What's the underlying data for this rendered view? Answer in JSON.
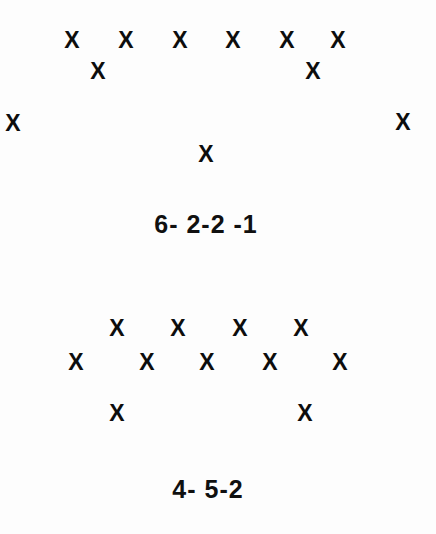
{
  "diagram": {
    "title_visible": false,
    "background_color": "#fdfdfd",
    "marker_color": "#0d0d0d",
    "marker_glyph": "X",
    "formations": [
      {
        "name": "formation-top",
        "label": "6- 2-2 -1",
        "label_position": {
          "x": 206,
          "y": 224
        },
        "player_count": 11,
        "lines": "6-2-2-1",
        "players": [
          {
            "id": "t1",
            "glyph": "X",
            "x": 72,
            "y": 40,
            "row": 1
          },
          {
            "id": "t2",
            "glyph": "X",
            "x": 126,
            "y": 40,
            "row": 1
          },
          {
            "id": "t3",
            "glyph": "X",
            "x": 180,
            "y": 40,
            "row": 1
          },
          {
            "id": "t4",
            "glyph": "X",
            "x": 233,
            "y": 40,
            "row": 1
          },
          {
            "id": "t5",
            "glyph": "X",
            "x": 287,
            "y": 40,
            "row": 1
          },
          {
            "id": "t6",
            "glyph": "X",
            "x": 338,
            "y": 40,
            "row": 1
          },
          {
            "id": "t7",
            "glyph": "X",
            "x": 98,
            "y": 71,
            "row": 2
          },
          {
            "id": "t8",
            "glyph": "X",
            "x": 313,
            "y": 71,
            "row": 2
          },
          {
            "id": "t9",
            "glyph": "X",
            "x": 13,
            "y": 123,
            "row": 3
          },
          {
            "id": "t10",
            "glyph": "X",
            "x": 403,
            "y": 122,
            "row": 3
          },
          {
            "id": "t11",
            "glyph": "X",
            "x": 206,
            "y": 154,
            "row": 4
          }
        ]
      },
      {
        "name": "formation-bottom",
        "label": "4- 5-2",
        "label_position": {
          "x": 208,
          "y": 489
        },
        "player_count": 11,
        "lines": "4-5-2",
        "players": [
          {
            "id": "b1",
            "glyph": "X",
            "x": 117,
            "y": 328,
            "row": 1
          },
          {
            "id": "b2",
            "glyph": "X",
            "x": 178,
            "y": 328,
            "row": 1
          },
          {
            "id": "b3",
            "glyph": "X",
            "x": 240,
            "y": 328,
            "row": 1
          },
          {
            "id": "b4",
            "glyph": "X",
            "x": 301,
            "y": 328,
            "row": 1
          },
          {
            "id": "b5",
            "glyph": "X",
            "x": 76,
            "y": 362,
            "row": 2
          },
          {
            "id": "b6",
            "glyph": "X",
            "x": 147,
            "y": 362,
            "row": 2
          },
          {
            "id": "b7",
            "glyph": "X",
            "x": 207,
            "y": 362,
            "row": 2
          },
          {
            "id": "b8",
            "glyph": "X",
            "x": 270,
            "y": 362,
            "row": 2
          },
          {
            "id": "b9",
            "glyph": "X",
            "x": 340,
            "y": 362,
            "row": 2
          },
          {
            "id": "b10",
            "glyph": "X",
            "x": 117,
            "y": 413,
            "row": 3
          },
          {
            "id": "b11",
            "glyph": "X",
            "x": 305,
            "y": 413,
            "row": 3
          }
        ]
      }
    ]
  }
}
